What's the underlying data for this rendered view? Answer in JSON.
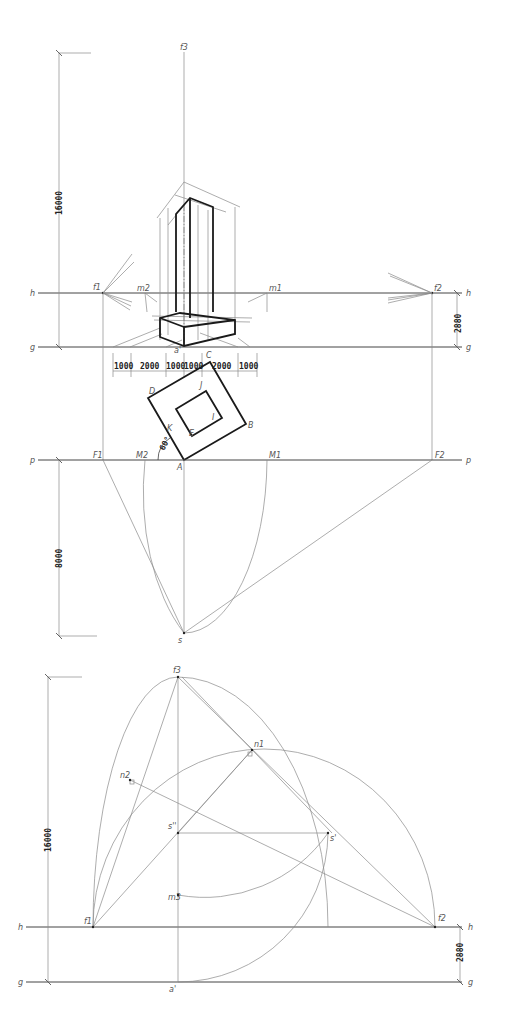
{
  "top_diagram": {
    "labels": {
      "f3": "f3",
      "f1": "f1",
      "f2": "f2",
      "m1": "m1",
      "m2": "m2",
      "h_left": "h",
      "h_right": "h",
      "g_left": "g",
      "g_right": "g",
      "a_prime": "a'",
      "p_left": "p",
      "p_right": "p",
      "F1": "F1",
      "F2": "F2",
      "M1": "M1",
      "M2": "M2",
      "A": "A",
      "B": "B",
      "C": "C",
      "D": "D",
      "E": "E",
      "I": "I",
      "J": "J",
      "K": "K",
      "s": "s",
      "angle": "60°"
    },
    "dimensions": {
      "height": "16000",
      "horizon": "2880",
      "distance": "8000",
      "base_segments": [
        "1000",
        "2000",
        "1000",
        "1000",
        "2000",
        "1000"
      ]
    }
  },
  "bottom_diagram": {
    "labels": {
      "f3": "f3",
      "n1": "n1",
      "n2": "n2",
      "s_double": "s''",
      "s_prime": "s'",
      "m3": "m3",
      "f1": "f1",
      "f2": "f2",
      "h_left": "h",
      "h_right": "h",
      "g_left": "g",
      "g_right": "g",
      "a_prime": "a'"
    },
    "dimensions": {
      "height": "16000",
      "horizon": "2880"
    }
  }
}
